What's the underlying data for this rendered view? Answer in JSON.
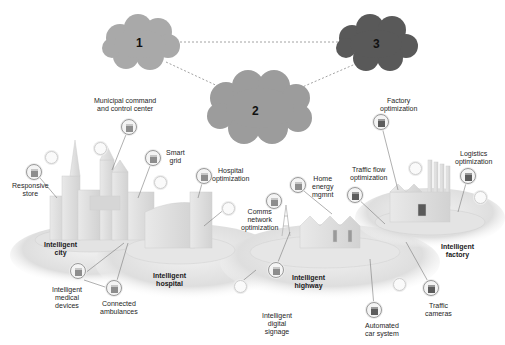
{
  "diagram": {
    "type": "tiered cloud / edge network over intelligent infrastructure",
    "colors": {
      "cloud_1": "#a9a9a9",
      "cloud_2": "#9c9c9c",
      "cloud_3": "#595959",
      "connector": "#8a8a8a",
      "platform": "#e6e6e6"
    },
    "clouds": [
      {
        "id": "1",
        "label": "1"
      },
      {
        "id": "2",
        "label": "2"
      },
      {
        "id": "3",
        "label": "3"
      }
    ],
    "links": [
      [
        "1",
        "3"
      ],
      [
        "1",
        "2"
      ],
      [
        "2",
        "3"
      ]
    ],
    "zones": {
      "city": "Intelligent\ncity",
      "hospital": "Intelligent\nhospital",
      "highway": "Intelligent\nhighway",
      "factory": "Intelligent\nfactory"
    },
    "callouts": {
      "municipal": "Municipal command\nand control center",
      "smart_grid": "Smart\ngrid",
      "responsive_store": "Responsive\nstore",
      "hospital_opt": "Hospital\noptimization",
      "comms": "Comms\nnetwork\noptimization",
      "home_energy": "Home\nenergy\nmgmnt",
      "traffic_flow": "Traffic flow\noptimization",
      "factory_opt": "Factory\noptimization",
      "logistics": "Logistics\noptimization",
      "medical_devices": "Intelligent\nmedical\ndevices",
      "ambulances": "Connected\nambulances",
      "digital_signage": "Intelligent\ndigital\nsignage",
      "automated_car": "Automated\ncar system",
      "traffic_cameras": "Traffic\ncameras"
    }
  }
}
